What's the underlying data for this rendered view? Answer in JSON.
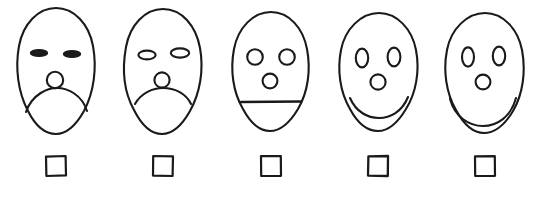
{
  "scale": {
    "title": "Face rating scale",
    "instruction": "",
    "ink_color": "#1a1a1a",
    "background_color": "#ffffff",
    "option_count": 5,
    "options": [
      {
        "id": "face-1",
        "label": "Very unhappy",
        "position": 1,
        "expression": "deep frown",
        "eye_style": "narrow-slit-filled",
        "mouth_style": "deep-frown",
        "checkbox_state": "unchecked",
        "checkbox_label": ""
      },
      {
        "id": "face-2",
        "label": "Unhappy",
        "position": 2,
        "expression": "frown",
        "eye_style": "flat-oval-outline",
        "mouth_style": "shallow-frown",
        "checkbox_state": "unchecked",
        "checkbox_label": ""
      },
      {
        "id": "face-3",
        "label": "Neutral",
        "position": 3,
        "expression": "neutral",
        "eye_style": "round-circle-outline",
        "mouth_style": "straight-line",
        "checkbox_state": "unchecked",
        "checkbox_label": ""
      },
      {
        "id": "face-4",
        "label": "Happy",
        "position": 4,
        "expression": "smile",
        "eye_style": "tall-oval-outline",
        "mouth_style": "shallow-smile",
        "checkbox_state": "unchecked",
        "checkbox_label": ""
      },
      {
        "id": "face-5",
        "label": "Very happy",
        "position": 5,
        "expression": "big smile",
        "eye_style": "tall-oval-outline",
        "mouth_style": "deep-smile",
        "checkbox_state": "unchecked",
        "checkbox_label": ""
      }
    ]
  }
}
